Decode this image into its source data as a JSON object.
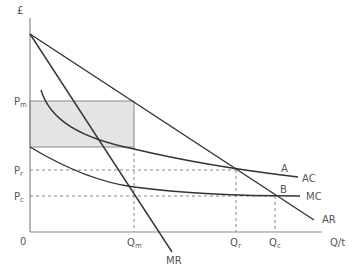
{
  "diagram": {
    "axes": {
      "y_label": "£",
      "x_label": "Q/t",
      "origin": "0"
    },
    "price_labels": [
      {
        "main": "P",
        "sub": "m"
      },
      {
        "main": "P",
        "sub": "r"
      },
      {
        "main": "P",
        "sub": "c"
      }
    ],
    "quantity_labels": [
      {
        "main": "Q",
        "sub": "m"
      },
      {
        "main": "Q",
        "sub": "r"
      },
      {
        "main": "Q",
        "sub": "c"
      }
    ],
    "curves": {
      "AC": "AC",
      "MC": "MC",
      "AR": "AR",
      "MR": "MR"
    },
    "points": {
      "A": "A",
      "B": "B"
    },
    "colors": {
      "line": "#333333",
      "axis": "#888888",
      "shade": "#e4e4e4",
      "dash": "#777777"
    }
  }
}
